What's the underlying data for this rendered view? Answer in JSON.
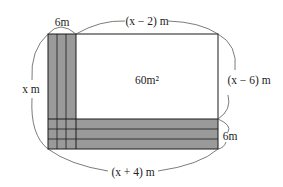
{
  "diagram": {
    "labels": {
      "top_strip_width": "6m",
      "top_length": "(x − 2) m",
      "left_side": "x m",
      "area": "60m²",
      "right_side": "(x − 6) m",
      "bottom_strip_height": "6m",
      "bottom_length": "(x + 4) m"
    },
    "colors": {
      "strip_fill": "#9a9a9a",
      "line": "#1a1a1a",
      "background": "#ffffff"
    }
  }
}
